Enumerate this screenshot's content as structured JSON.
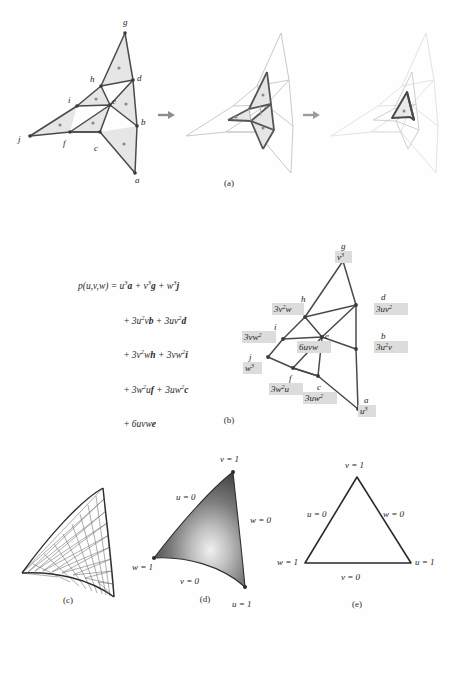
{
  "figure": {
    "background": "#fefefe",
    "ink": "#2b2b2b",
    "fill_gray": "#e2e2e2",
    "mid_gray": "#9a9a9a",
    "light_gray": "#d8d8d8",
    "faint_gray": "#ececec",
    "label_box_fill": "#dcdcdc"
  },
  "captions": {
    "a": "(a)",
    "b": "(b)",
    "c": "(c)",
    "d": "(d)",
    "e": "(e)"
  },
  "panel_a": {
    "name": "subdivision-sequence",
    "arrow_glyph": "→",
    "vertex_labels": [
      "g",
      "h",
      "d",
      "i",
      "e",
      "b",
      "j",
      "f",
      "c",
      "a"
    ],
    "steps": 3
  },
  "panel_b": {
    "name": "bezier-triangle-control-net",
    "equation": {
      "lhs": "p(u,v,w)",
      "lines": [
        "p(u,v,w) = u³a + v³g + w³j",
        "+ 3u²vb + 3uv²d",
        "+ 3v²wh + 3vw²i",
        "+ 3w²uf + 3uw²c",
        "+ 6uvwe"
      ]
    },
    "control_points": [
      {
        "label": "g",
        "weight": "v³"
      },
      {
        "label": "h",
        "weight": "3v²w"
      },
      {
        "label": "d",
        "weight": "3uv²"
      },
      {
        "label": "i",
        "weight": "3vw²"
      },
      {
        "label": "e",
        "weight": "6uvw"
      },
      {
        "label": "b",
        "weight": "3u²v"
      },
      {
        "label": "j",
        "weight": "w³"
      },
      {
        "label": "f",
        "weight": "3w²u"
      },
      {
        "label": "c",
        "weight": "3uw²"
      },
      {
        "label": "a",
        "weight": "u³"
      }
    ]
  },
  "panel_c": {
    "name": "tessellated-surface-wireframe",
    "description": "triangular wireframe mesh on curved patch"
  },
  "panel_d": {
    "name": "shaded-surface-patch",
    "edge_labels": [
      {
        "id": "v1",
        "text": "v = 1"
      },
      {
        "id": "u0",
        "text": "u = 0"
      },
      {
        "id": "w0",
        "text": "w = 0"
      },
      {
        "id": "w1",
        "text": "w = 1"
      },
      {
        "id": "v0",
        "text": "v = 0"
      },
      {
        "id": "u1",
        "text": "u = 1"
      }
    ]
  },
  "panel_e": {
    "name": "parameter-domain-triangle",
    "edge_labels": [
      {
        "id": "v1",
        "text": "v = 1"
      },
      {
        "id": "u0",
        "text": "u = 0"
      },
      {
        "id": "w0",
        "text": "w = 0"
      },
      {
        "id": "w1",
        "text": "w = 1"
      },
      {
        "id": "v0",
        "text": "v = 0"
      },
      {
        "id": "u1",
        "text": "u = 1"
      }
    ]
  }
}
